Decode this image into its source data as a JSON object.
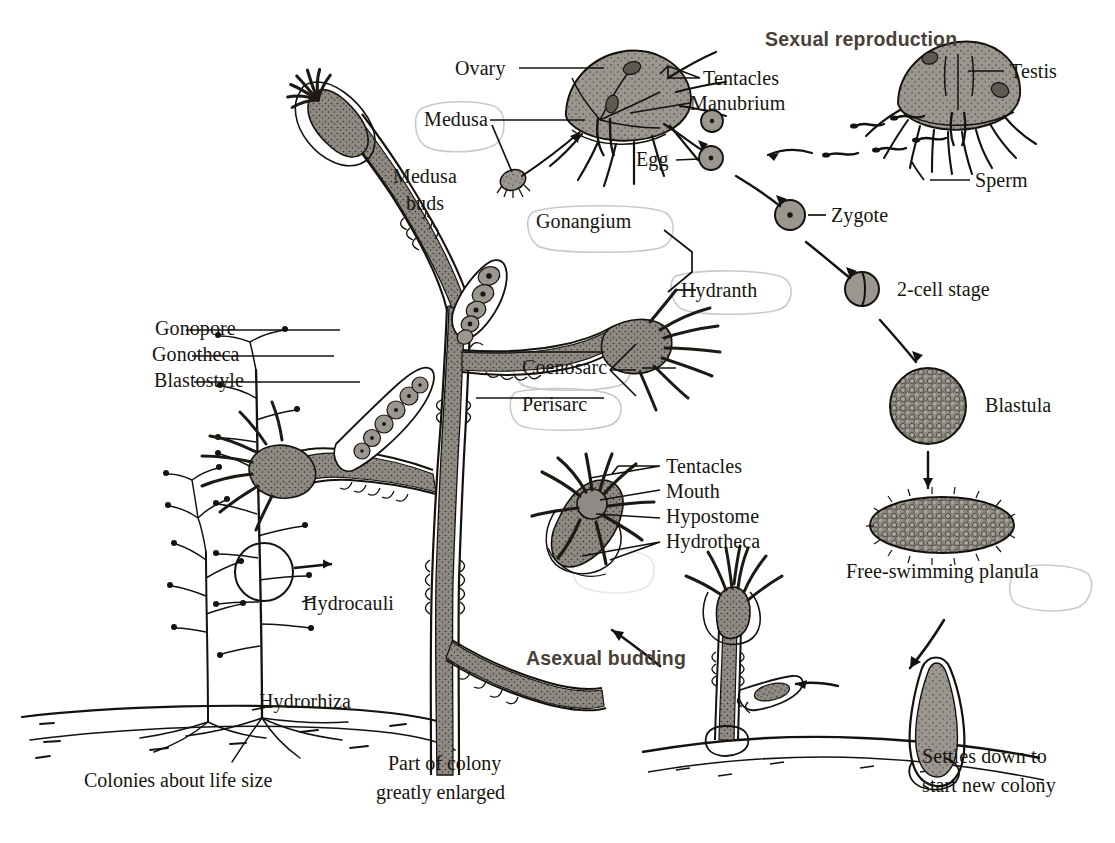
{
  "figure": {
    "background": "#ffffff",
    "ink": "#17140f",
    "heading_color": "#4a4038",
    "tissue_fill": "#8f8b84",
    "highlight_color": "#c9c9c9"
  },
  "headings": {
    "sexual": "Sexual reproduction",
    "asexual": "Asexual budding"
  },
  "labels": {
    "ovary": "Ovary",
    "tentacles_medusa": "Tentacles",
    "manubrium": "Manubrium",
    "testis": "Testis",
    "sperm": "Sperm",
    "egg": "Egg",
    "zygote": "Zygote",
    "two_cell": "2-cell stage",
    "blastula": "Blastula",
    "planula": "Free-swimming planula",
    "settles_line1": "Settles down to",
    "settles_line2": "start new colony",
    "medusa": "Medusa",
    "medusa_buds_line1": "Medusa",
    "medusa_buds_line2": "buds",
    "gonangium": "Gonangium",
    "hydranth": "Hydranth",
    "coenosarc": "Coenosarc",
    "perisarc": "Perisarc",
    "gonopore": "Gonopore",
    "gonotheca": "Gonotheca",
    "blastostyle": "Blastostyle",
    "tentacles_polyp": "Tentacles",
    "mouth": "Mouth",
    "hypostome": "Hypostome",
    "hydrotheca": "Hydrotheca",
    "hydrocauli": "Hydrocauli",
    "hydrorhiza": "Hydrorhiza"
  },
  "captions": {
    "colonies_life_size": "Colonies about life size",
    "part_of_colony_line1": "Part of colony",
    "part_of_colony_line2": "greatly enlarged"
  }
}
